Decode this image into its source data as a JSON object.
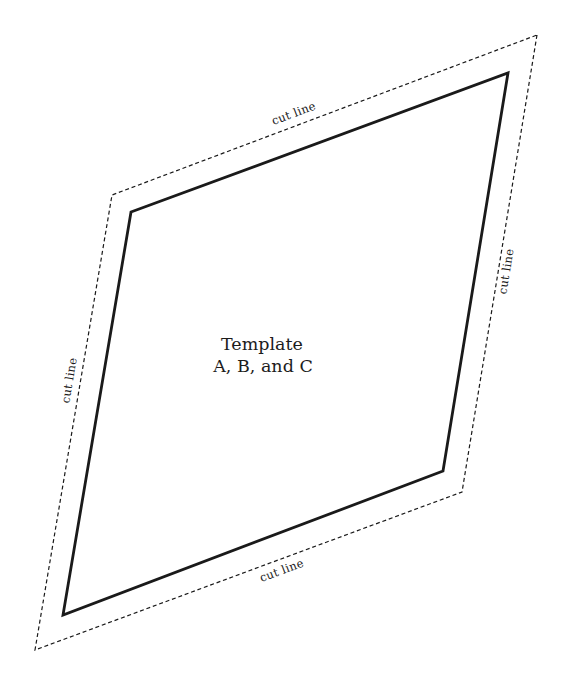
{
  "page": {
    "background_color": "#ffffff",
    "ink_color": "#1a1a1a"
  },
  "diagram": {
    "outer_cut_line": {
      "points": "537,35 462,492 35,650 112,195",
      "labels": {
        "top": "cut line",
        "right": "cut line",
        "bottom": "cut line",
        "left": "cut line"
      }
    },
    "template_outline": {
      "points": "508,73 443,471 63,615 131,212"
    },
    "center_label": {
      "line1": "Template",
      "line2": "A, B, and C"
    }
  }
}
